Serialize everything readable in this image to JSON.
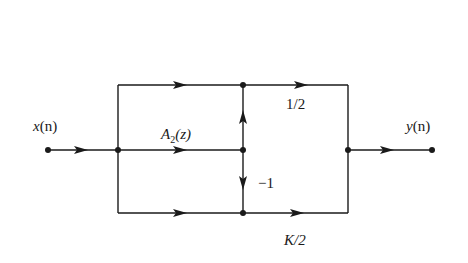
{
  "diagram": {
    "type": "signal-flow-graph",
    "line_color": "#1a1a1a",
    "background": "#ffffff",
    "labels": {
      "input": "x(n)",
      "input_var": "x",
      "input_arg": "(n)",
      "output": "y(n)",
      "output_var": "y",
      "output_arg": "(n)",
      "allpass": "A2(z)",
      "allpass_A": "A",
      "allpass_sub": "2",
      "allpass_arg": "(z)",
      "gain_top": "1/2",
      "gain_neg": "−1",
      "gain_bottom": "K/2"
    },
    "nodes": [
      {
        "id": "input",
        "x": 48,
        "y": 150
      },
      {
        "id": "split",
        "x": 118,
        "y": 150
      },
      {
        "id": "top-mid",
        "x": 243,
        "y": 85
      },
      {
        "id": "mid",
        "x": 243,
        "y": 150
      },
      {
        "id": "bottom-mid",
        "x": 243,
        "y": 213
      },
      {
        "id": "sum",
        "x": 348,
        "y": 150
      },
      {
        "id": "output",
        "x": 432,
        "y": 150
      }
    ],
    "branches": [
      {
        "from": "input",
        "to": "split",
        "gain": ""
      },
      {
        "from": "split",
        "to": "top-mid",
        "gain": ""
      },
      {
        "from": "split",
        "to": "mid",
        "gain": "A2(z)"
      },
      {
        "from": "split",
        "to": "bottom-mid",
        "gain": ""
      },
      {
        "from": "mid",
        "to": "top-mid",
        "gain": ""
      },
      {
        "from": "mid",
        "to": "bottom-mid",
        "gain": "−1"
      },
      {
        "from": "top-mid",
        "to": "sum",
        "gain": "1/2"
      },
      {
        "from": "bottom-mid",
        "to": "sum",
        "gain": "K/2"
      },
      {
        "from": "sum",
        "to": "output",
        "gain": ""
      }
    ]
  }
}
